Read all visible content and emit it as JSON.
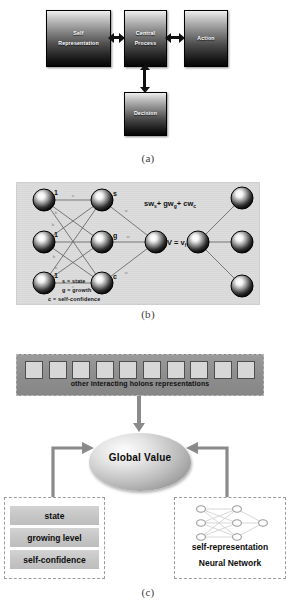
{
  "figure": {
    "captions": {
      "a": "(a)",
      "b": "(b)",
      "c": "(c)"
    }
  },
  "panel_a": {
    "blocks": [
      {
        "id": "self-representation",
        "line1": "Self",
        "line2": "Representation"
      },
      {
        "id": "central-process",
        "line1": "Central",
        "line2": "Process"
      },
      {
        "id": "action",
        "line1": "Action",
        "line2": ""
      },
      {
        "id": "decision",
        "line1": "Decision",
        "line2": ""
      }
    ],
    "connections": [
      {
        "from": "self-representation",
        "to": "central-process",
        "type": "bidirectional"
      },
      {
        "from": "central-process",
        "to": "action",
        "type": "bidirectional"
      },
      {
        "from": "central-process",
        "to": "decision",
        "type": "bidirectional"
      }
    ]
  },
  "panel_b": {
    "input_nodes": [
      {
        "label": "1"
      },
      {
        "label": "1"
      },
      {
        "label": "1"
      }
    ],
    "hidden_nodes": [
      {
        "label": "s"
      },
      {
        "label": "g"
      },
      {
        "label": "c"
      }
    ],
    "edge_weights": [
      "a",
      "b",
      "b",
      "b",
      "b",
      "b",
      "b",
      "b",
      "c"
    ],
    "output_weights": [
      "w",
      "w",
      "w"
    ],
    "formula": "swₛ+ gw₉+ cwᴄ",
    "value_label": "V = vғ",
    "legend": [
      "s = state",
      "g = growth",
      "c = self-confidence"
    ]
  },
  "panel_c": {
    "holon_strip": {
      "label": "other interacting holons representations",
      "square_count": 10
    },
    "global_value": "Global Value",
    "left_box": {
      "attributes": [
        "state",
        "growing level",
        "self-confidence"
      ]
    },
    "right_box": {
      "line1": "self-representation",
      "line2": "Neural Network",
      "network_layers": [
        3,
        3,
        1
      ]
    }
  },
  "colors": {
    "block_dark": "#050505",
    "block_light": "#efefef",
    "panel_b_bg": "#dcdcdc",
    "holon_strip": "#8d8d8d",
    "arrow_gray": "#8a8a8a",
    "attr_bar": "#c6c6c6"
  }
}
